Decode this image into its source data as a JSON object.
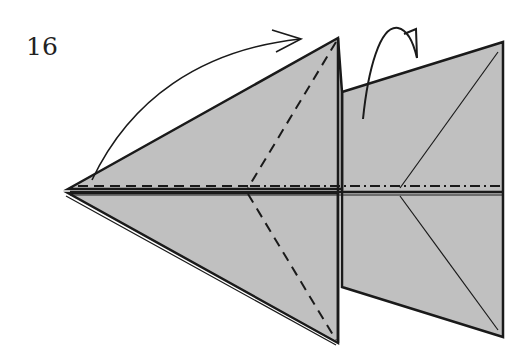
{
  "step": {
    "number": "16"
  },
  "colors": {
    "paper": "#c0c0c0",
    "line": "#1a1a1a",
    "background": "#ffffff"
  },
  "symbols": {
    "fold_arrow": "curved-arrow-valley-fold-up-right",
    "flip_arrow": "turn-over-arrow",
    "valley_fold": "dashed-line",
    "mountain_fold": "dash-dot-line"
  }
}
